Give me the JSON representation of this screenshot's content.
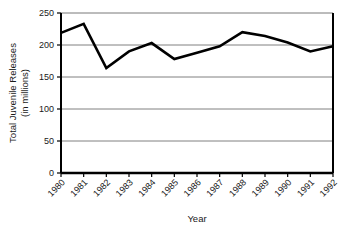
{
  "chart_data": {
    "type": "line",
    "title": "",
    "xlabel": "Year",
    "ylabel": "Total Juvenile Releases (in millions)",
    "ylabel_line1": "Total Juvenile Releases",
    "ylabel_line2": "(in millions)",
    "categories": [
      "1980",
      "1981",
      "1982",
      "1983",
      "1984",
      "1985",
      "1986",
      "1987",
      "1988",
      "1989",
      "1990",
      "1991",
      "1992"
    ],
    "values": [
      219,
      233,
      164,
      190,
      203,
      178,
      188,
      198,
      220,
      214,
      204,
      190,
      198
    ],
    "series": [
      {
        "name": "Total Juvenile Releases",
        "values": [
          219,
          233,
          164,
          190,
          203,
          178,
          188,
          198,
          220,
          214,
          204,
          190,
          198
        ]
      }
    ],
    "ylim": [
      0,
      250
    ],
    "yticks": [
      0,
      50,
      100,
      150,
      200,
      250
    ],
    "ytick_labels": [
      "0",
      "50",
      "100",
      "150",
      "200",
      "250"
    ],
    "grid": true,
    "grid_axis": "y",
    "legend": "none",
    "line_color": "#000000",
    "grid_color": "#808080",
    "axis_color": "#000000",
    "background_color": "#ffffff",
    "xtick_rotation": -45
  }
}
